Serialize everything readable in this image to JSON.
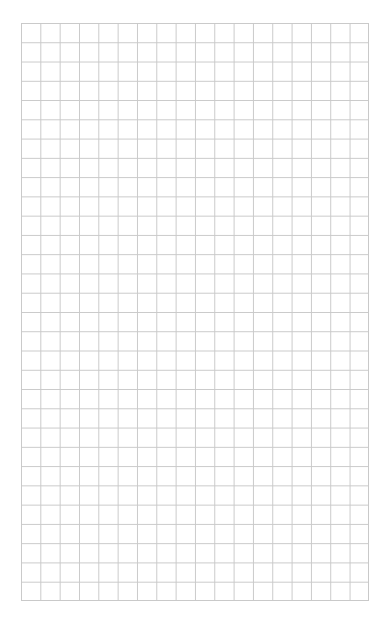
{
  "page": {
    "type": "graph-paper",
    "background_color": "#ffffff",
    "line_color": "#c9c9c9"
  },
  "grid": {
    "columns": 18,
    "rows": 30
  }
}
